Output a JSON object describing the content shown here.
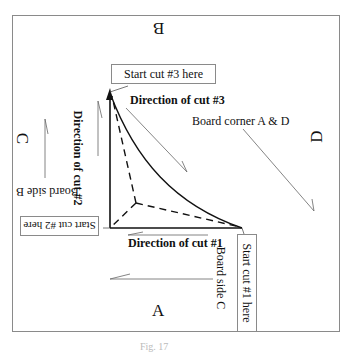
{
  "diagram": {
    "sides": {
      "top": "B",
      "left": "C",
      "right": "D",
      "bottom": "A"
    },
    "callouts": {
      "start_cut_3": "Start cut #3 here",
      "start_cut_2": "Start cut #2 here",
      "start_cut_1": "Start cut #1 here"
    },
    "directions": {
      "cut_3": "Direction of cut #3",
      "cut_2": "Direction of cut #2",
      "cut_1": "Direction of cut #1"
    },
    "annotations": {
      "board_corner": "Board corner A & D",
      "board_side_b": "Board side B",
      "board_side_c": "Board side C"
    },
    "caption": "Fig. 17"
  }
}
